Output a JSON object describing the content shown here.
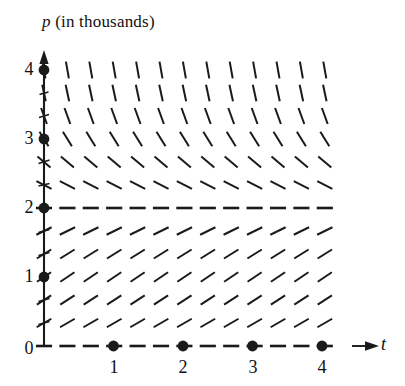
{
  "figure": {
    "kind": "slope-field",
    "background_color": "#ffffff",
    "ink_color": "#1a1a1a",
    "width": 405,
    "height": 386
  },
  "labels": {
    "p_axis_title_variable": "p",
    "p_axis_title_rest": " (in thousands)",
    "t_axis_letter": "t",
    "origin_label": "0",
    "p_ticks": [
      "1",
      "2",
      "3",
      "4"
    ],
    "t_ticks": [
      "1",
      "2",
      "3",
      "4"
    ]
  },
  "chart_data": {
    "type": "scatter",
    "title": "p (in thousands)",
    "xlabel": "t",
    "ylabel": "p (in thousands)",
    "grid": false,
    "legend": null,
    "xlim": [
      0,
      4.6
    ],
    "ylim": [
      0,
      4.3
    ],
    "xticks": [
      0,
      1,
      2,
      3,
      4
    ],
    "yticks": [
      0,
      1,
      2,
      3,
      4
    ],
    "xtick_labels": [
      "0",
      "1",
      "2",
      "3",
      "4"
    ],
    "ytick_labels": [
      "0",
      "1",
      "2",
      "3",
      "4"
    ],
    "equilibria": [
      0,
      2
    ],
    "mark_geometry": {
      "x_start": 44,
      "x_step": 23.4,
      "n_cols": 13,
      "y_p0": 346,
      "y_step": -23.0,
      "n_rows": 13,
      "mark_half_length": 8.5
    },
    "rows": [
      {
        "p": 0.0,
        "y": 346,
        "slope_deg": 0,
        "note": "equilibrium dashes"
      },
      {
        "p": 0.333,
        "y": 323,
        "slope_deg": 30,
        "note": "positive"
      },
      {
        "p": 0.667,
        "y": 300,
        "slope_deg": 33,
        "note": "positive"
      },
      {
        "p": 1.0,
        "y": 277,
        "slope_deg": 34,
        "note": "positive"
      },
      {
        "p": 1.333,
        "y": 254,
        "slope_deg": 32,
        "note": "positive"
      },
      {
        "p": 1.667,
        "y": 231,
        "slope_deg": 26,
        "note": "positive"
      },
      {
        "p": 2.0,
        "y": 208,
        "slope_deg": 0,
        "note": "equilibrium dashes"
      },
      {
        "p": 2.333,
        "y": 185,
        "slope_deg": -27,
        "note": "negative"
      },
      {
        "p": 2.667,
        "y": 162,
        "slope_deg": -40,
        "note": "negative"
      },
      {
        "p": 3.0,
        "y": 139,
        "slope_deg": -58,
        "note": "negative steeper"
      },
      {
        "p": 3.333,
        "y": 116,
        "slope_deg": -70,
        "note": "negative steeper"
      },
      {
        "p": 3.667,
        "y": 93,
        "slope_deg": -78,
        "note": "nearly vertical"
      },
      {
        "p": 4.0,
        "y": 70,
        "slope_deg": -80,
        "note": "nearly vertical"
      }
    ],
    "points": [
      {
        "t": 0,
        "p": 1,
        "label": "1"
      },
      {
        "t": 0,
        "p": 2,
        "label": "2"
      },
      {
        "t": 0,
        "p": 3,
        "label": "3"
      },
      {
        "t": 0,
        "p": 4,
        "label": "4"
      },
      {
        "t": 1,
        "p": 0,
        "label": "1"
      },
      {
        "t": 2,
        "p": 0,
        "label": "2"
      },
      {
        "t": 3,
        "p": 0,
        "label": "3"
      },
      {
        "t": 4,
        "p": 0,
        "label": "4"
      }
    ],
    "axes": {
      "origin_px": {
        "x": 44,
        "y": 346
      },
      "p_axis_top_px": 55,
      "t_axis_right_px": 360,
      "unit_px_x": 69.5,
      "unit_px_y": 69.0,
      "arrowheads": [
        "p-axis-top",
        "t-axis-right"
      ]
    }
  }
}
